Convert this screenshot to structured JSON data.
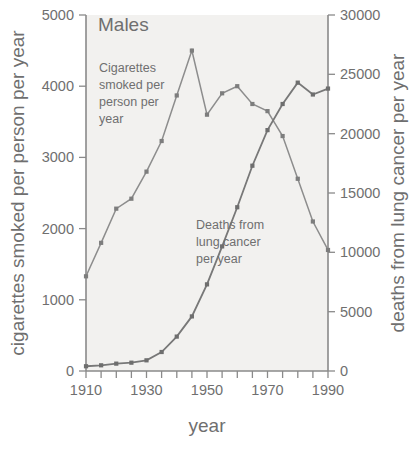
{
  "panel": {
    "title": "Males"
  },
  "axes": {
    "x": {
      "label": "year",
      "ticks": [
        1910,
        1920,
        1930,
        1940,
        1950,
        1960,
        1970,
        1980,
        1990
      ],
      "tick_labels": [
        "1910",
        "",
        "1930",
        "",
        "1950",
        "",
        "1970",
        "",
        "1990"
      ],
      "range": [
        1910,
        1990
      ],
      "minor_step": 5
    },
    "y_left": {
      "label": "cigarettes smoked per person per year",
      "ticks": [
        0,
        1000,
        2000,
        3000,
        4000,
        5000
      ],
      "tick_labels": [
        "0",
        "1000",
        "2000",
        "3000",
        "4000",
        "5000"
      ],
      "range": [
        0,
        5000
      ]
    },
    "y_right": {
      "label": "deaths from lung cancer per year",
      "ticks": [
        0,
        5000,
        10000,
        15000,
        20000,
        25000,
        30000
      ],
      "tick_labels": [
        "0",
        "5000",
        "10000",
        "15000",
        "20000",
        "25000",
        "30000"
      ],
      "range": [
        0,
        30000
      ]
    }
  },
  "annotations": {
    "cigarettes": [
      "Cigarettes",
      "smoked per",
      "person per",
      "year"
    ],
    "deaths": [
      "Deaths from",
      "lung cancer",
      "per year"
    ]
  },
  "colors": {
    "plot_background": "#f2f1ef",
    "axis": "#8a8a8a",
    "cigarettes_series": "#8d8d8d",
    "deaths_series": "#787878",
    "text": "#6f6f6f"
  },
  "chart_data": {
    "type": "line",
    "title": "Males",
    "xlabel": "year",
    "ylabel": "cigarettes smoked per person per year",
    "y2label": "deaths from lung cancer per year",
    "xlim": [
      1910,
      1990
    ],
    "ylim": [
      0,
      5000
    ],
    "y2lim": [
      0,
      30000
    ],
    "grid": false,
    "legend": "inline-annotation",
    "x": [
      1910,
      1915,
      1920,
      1925,
      1930,
      1935,
      1940,
      1945,
      1950,
      1955,
      1960,
      1965,
      1970,
      1975,
      1980,
      1985,
      1990
    ],
    "series": [
      {
        "name": "Cigarettes smoked per person per year",
        "axis": "left",
        "units": "cigarettes per person per year",
        "values": [
          1330,
          1800,
          2280,
          2420,
          2800,
          3230,
          3870,
          4500,
          3600,
          3900,
          4000,
          3750,
          3650,
          3300,
          2700,
          2100,
          1700
        ]
      },
      {
        "name": "Deaths from lung cancer per year",
        "axis": "right",
        "units": "deaths per year",
        "values": [
          400,
          480,
          620,
          700,
          900,
          1600,
          2900,
          4600,
          7300,
          10500,
          13800,
          17300,
          20300,
          22500,
          24300,
          23300,
          23800
        ]
      }
    ]
  }
}
